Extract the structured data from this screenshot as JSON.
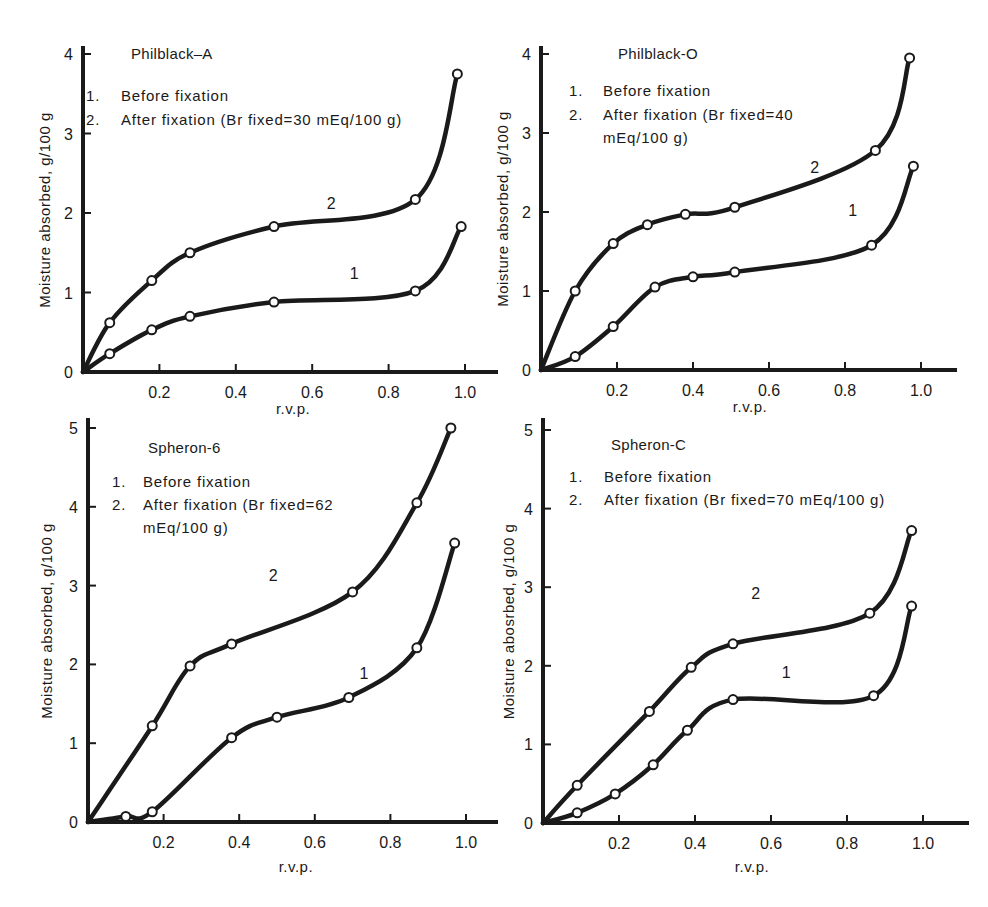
{
  "figure": {
    "panels_count": 4
  },
  "chart_data": [
    {
      "type": "line",
      "title": "Philblack–A",
      "legend": [
        "1.  Before fixation",
        "2.  After fixation (Br fixed=30 mEq/100 g)"
      ],
      "legend_lines": [
        "Before fixation",
        "After fixation (Br fixed=30 mEq/100 g)"
      ],
      "xlabel": "r.v.p.",
      "ylabel": "Moisture absorbed, g/100 g",
      "xlim": [
        0,
        1.1
      ],
      "ylim": [
        0,
        4
      ],
      "xticks": [
        "0.2",
        "0.4",
        "0.6",
        "0.8",
        "1.0"
      ],
      "yticks": [
        "0",
        "1",
        "2",
        "3",
        "4"
      ],
      "grid": false,
      "series": [
        {
          "name": "1",
          "label": "Before fixation",
          "x": [
            0.07,
            0.18,
            0.28,
            0.5,
            0.87,
            0.99
          ],
          "y": [
            0.23,
            0.53,
            0.7,
            0.88,
            1.02,
            1.83
          ]
        },
        {
          "name": "2",
          "label": "After fixation (Br fixed=30 mEq/100 g)",
          "x": [
            0.07,
            0.18,
            0.28,
            0.5,
            0.87,
            0.98
          ],
          "y": [
            0.62,
            1.15,
            1.5,
            1.83,
            2.17,
            3.75
          ]
        }
      ]
    },
    {
      "type": "line",
      "title": "Philblack-O",
      "legend_lines": [
        "Before fixation",
        "After fixation (Br fixed=40",
        "mEq/100 g)"
      ],
      "xlabel": "r.v.p.",
      "ylabel": "Moisture absorbed, g/100 g",
      "xlim": [
        0,
        1.1
      ],
      "ylim": [
        0,
        4
      ],
      "xticks": [
        "0.2",
        "0.4",
        "0.6",
        "0.8",
        "1.0"
      ],
      "yticks": [
        "0",
        "1",
        "2",
        "3",
        "4"
      ],
      "grid": false,
      "series": [
        {
          "name": "1",
          "label": "Before fixation",
          "x": [
            0.09,
            0.19,
            0.3,
            0.4,
            0.51,
            0.87,
            0.98
          ],
          "y": [
            0.17,
            0.55,
            1.05,
            1.18,
            1.24,
            1.58,
            2.58
          ]
        },
        {
          "name": "2",
          "label": "After fixation (Br fixed=40 mEq/100 g)",
          "x": [
            0.09,
            0.19,
            0.28,
            0.38,
            0.51,
            0.88,
            0.97
          ],
          "y": [
            1.0,
            1.6,
            1.84,
            1.97,
            2.06,
            2.78,
            3.95
          ]
        }
      ]
    },
    {
      "type": "line",
      "title": "Spheron-6",
      "legend_lines": [
        "Before fixation",
        "After fixation (Br fixed=62",
        "mEq/100 g)"
      ],
      "xlabel": "r.v.p.",
      "ylabel": "Moisture absorbed, g/100 g",
      "xlim": [
        0,
        1.1
      ],
      "ylim": [
        0,
        5
      ],
      "xticks": [
        "0.2",
        "0.4",
        "0.6",
        "0.8",
        "1.0"
      ],
      "yticks": [
        "0",
        "1",
        "2",
        "3",
        "4",
        "5"
      ],
      "grid": false,
      "series": [
        {
          "name": "1",
          "label": "Before fixation",
          "x": [
            0.1,
            0.17,
            0.38,
            0.5,
            0.69,
            0.87,
            0.97
          ],
          "y": [
            0.07,
            0.13,
            1.07,
            1.33,
            1.58,
            2.21,
            3.54
          ]
        },
        {
          "name": "2",
          "label": "After fixation (Br fixed=62 mEq/100 g)",
          "x": [
            0.17,
            0.27,
            0.38,
            0.7,
            0.87,
            0.96
          ],
          "y": [
            1.22,
            1.98,
            2.26,
            2.92,
            4.05,
            5.0
          ]
        }
      ]
    },
    {
      "type": "line",
      "title": "Spheron-C",
      "legend_lines": [
        "Before fixation",
        "After fixation (Br fixed=70 mEq/100 g)"
      ],
      "xlabel": "r.v.p.",
      "ylabel": "Moisture abosrbed, g/100 g",
      "xlim": [
        0,
        1.1
      ],
      "ylim": [
        0,
        5
      ],
      "xticks": [
        "0.2",
        "0.4",
        "0.6",
        "0.8",
        "1.0"
      ],
      "yticks": [
        "0",
        "1",
        "2",
        "3",
        "4",
        "5"
      ],
      "grid": false,
      "series": [
        {
          "name": "1",
          "label": "Before fixation",
          "x": [
            0.09,
            0.19,
            0.29,
            0.38,
            0.5,
            0.87,
            0.97
          ],
          "y": [
            0.13,
            0.37,
            0.74,
            1.18,
            1.57,
            1.62,
            2.76
          ]
        },
        {
          "name": "2",
          "label": "After fixation (Br fixed=70 mEq/100 g)",
          "x": [
            0.09,
            0.28,
            0.39,
            0.5,
            0.86,
            0.97
          ],
          "y": [
            0.48,
            1.42,
            1.98,
            2.28,
            2.67,
            3.72
          ]
        }
      ]
    }
  ],
  "layout": {
    "panels": [
      {
        "ox": 83,
        "oy": 372,
        "xscale": 382,
        "yscale": 79.5,
        "xend": 496,
        "ytop": 48,
        "title_xy": [
          131,
          59
        ],
        "legend_x": [
          86,
          121
        ],
        "legend_y": [
          101,
          125,
          149
        ],
        "labels": [
          {
            "text": "1",
            "x": 0.71,
            "y": 1.17
          },
          {
            "text": "2",
            "x": 0.65,
            "y": 2.05
          }
        ],
        "ylabel_x": 50,
        "xlabel_y": 414
      },
      {
        "ox": 541,
        "oy": 370,
        "xscale": 380,
        "yscale": 79,
        "xend": 955,
        "ytop": 48,
        "title_xy": [
          618,
          59
        ],
        "legend_x": [
          569,
          603
        ],
        "legend_y": [
          96,
          120,
          143
        ],
        "labels": [
          {
            "text": "1",
            "x": 0.82,
            "y": 1.95
          },
          {
            "text": "2",
            "x": 0.72,
            "y": 2.5
          }
        ],
        "ylabel_x": 508,
        "xlabel_y": 412
      },
      {
        "ox": 88,
        "oy": 822,
        "xscale": 378,
        "yscale": 78.8,
        "xend": 496,
        "ytop": 420,
        "title_xy": [
          148,
          453
        ],
        "legend_x": [
          112,
          143
        ],
        "legend_y": [
          487,
          510,
          533
        ],
        "labels": [
          {
            "text": "1",
            "x": 0.73,
            "y": 1.82
          },
          {
            "text": "2",
            "x": 0.49,
            "y": 3.06
          }
        ],
        "ylabel_x": 52,
        "xlabel_y": 872
      },
      {
        "ox": 543,
        "oy": 823,
        "xscale": 380,
        "yscale": 78.6,
        "xend": 967,
        "ytop": 420,
        "title_xy": [
          611,
          450
        ],
        "legend_x": [
          569,
          604
        ],
        "legend_y": [
          482,
          505,
          0
        ],
        "labels": [
          {
            "text": "1",
            "x": 0.64,
            "y": 1.85
          },
          {
            "text": "2",
            "x": 0.56,
            "y": 2.85
          }
        ],
        "ylabel_x": 514,
        "xlabel_y": 872
      }
    ]
  }
}
